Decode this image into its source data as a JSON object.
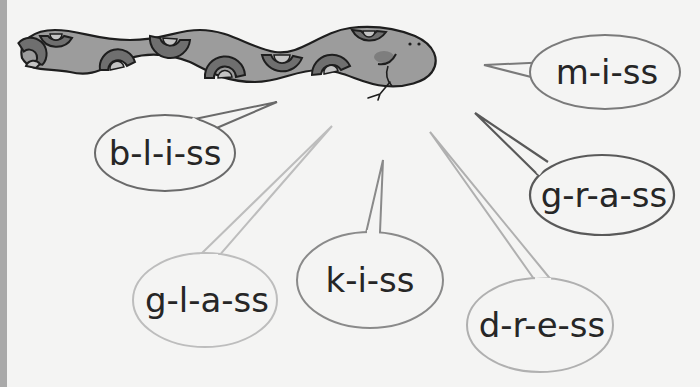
{
  "illustration": {
    "subject": "snake",
    "colors": {
      "background": "#f4f4f3",
      "edge_strip": "#a9a9a9",
      "snake_body": "#9c9c9c",
      "snake_pattern_dark": "#6f6f6f",
      "snake_pattern_light": "#c4c4c4",
      "snake_outline": "#1e1e1e",
      "snake_cheek": "#7e7e7e",
      "text": "#262626"
    }
  },
  "bubbles": [
    {
      "id": "bliss",
      "text": "b-l-i-ss",
      "stroke": "#6a6a6a"
    },
    {
      "id": "miss",
      "text": "m-i-ss",
      "stroke": "#7a7a7a"
    },
    {
      "id": "grass",
      "text": "g-r-a-ss",
      "stroke": "#595959"
    },
    {
      "id": "glass",
      "text": "g-l-a-ss",
      "stroke": "#bdbdbd"
    },
    {
      "id": "kiss",
      "text": "k-i-ss",
      "stroke": "#8a8a8a"
    },
    {
      "id": "dress",
      "text": "d-r-e-ss",
      "stroke": "#b0b0b0"
    }
  ]
}
